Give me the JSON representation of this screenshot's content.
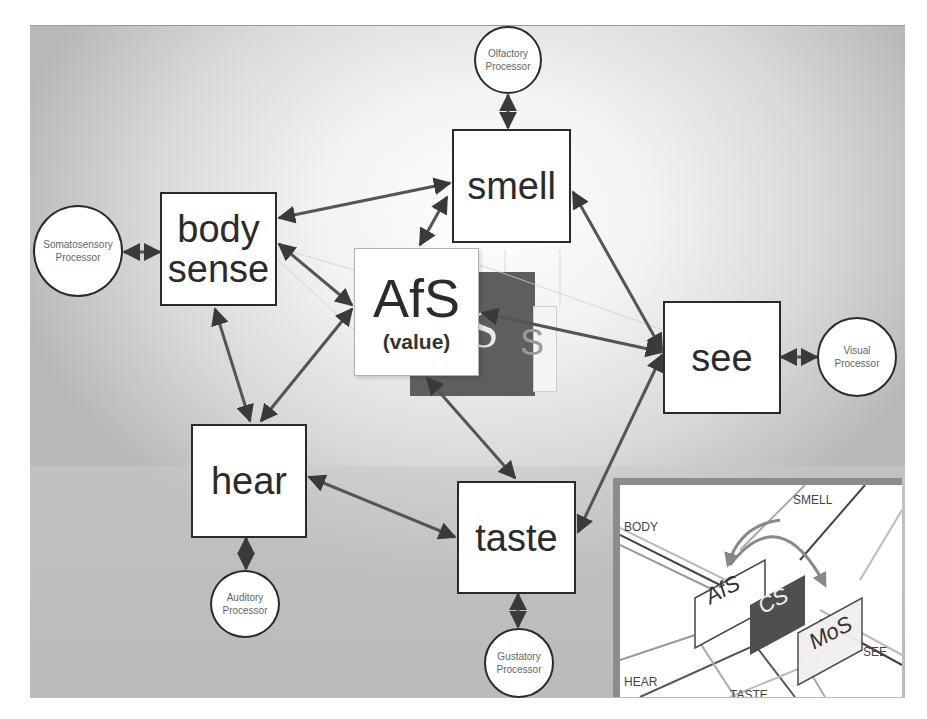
{
  "diagram": {
    "central_node": {
      "label": "AfS",
      "sublabel": "(value)"
    },
    "hidden_node_letters": {
      "cs": "S",
      "mos": "S"
    },
    "sense_nodes": [
      {
        "id": "smell",
        "label": "smell"
      },
      {
        "id": "body-sense",
        "label_line1": "body",
        "label_line2": "sense"
      },
      {
        "id": "see",
        "label": "see"
      },
      {
        "id": "hear",
        "label": "hear"
      },
      {
        "id": "taste",
        "label": "taste"
      }
    ],
    "processors": [
      {
        "id": "olfactory",
        "line1": "Olfactory",
        "line2": "Processor"
      },
      {
        "id": "somatosensory",
        "line1": "Somatosensory",
        "line2": "Processor"
      },
      {
        "id": "visual",
        "line1": "Visual",
        "line2": "Processor"
      },
      {
        "id": "auditory",
        "line1": "Auditory",
        "line2": "Processor"
      },
      {
        "id": "gustatory",
        "line1": "Gustatory",
        "line2": "Processor"
      }
    ],
    "connections": [
      [
        "olfactory",
        "smell"
      ],
      [
        "somatosensory",
        "body-sense"
      ],
      [
        "visual",
        "see"
      ],
      [
        "auditory",
        "hear"
      ],
      [
        "gustatory",
        "taste"
      ],
      [
        "body-sense",
        "smell"
      ],
      [
        "body-sense",
        "AfS"
      ],
      [
        "body-sense",
        "hear"
      ],
      [
        "smell",
        "AfS"
      ],
      [
        "smell",
        "see"
      ],
      [
        "AfS",
        "hear"
      ],
      [
        "AfS",
        "taste"
      ],
      [
        "AfS",
        "see"
      ],
      [
        "hear",
        "taste"
      ],
      [
        "taste",
        "see"
      ]
    ]
  },
  "inset": {
    "labels": {
      "smell": "SMELL",
      "body": "BODY",
      "see": "SEE",
      "hear": "HEAR",
      "taste": "TASTE"
    },
    "panels": {
      "afs": "AfS",
      "cs": "CS",
      "mos": "MoS"
    }
  }
}
